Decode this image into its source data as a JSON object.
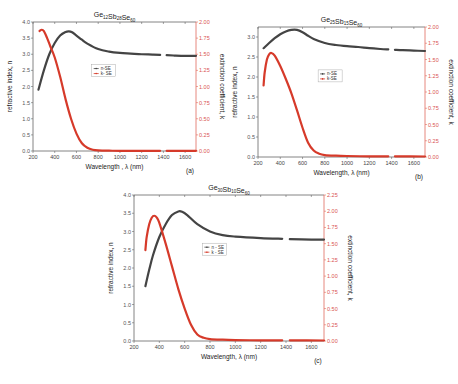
{
  "chart_data": [
    {
      "type": "line",
      "panel": "(a)",
      "title": "Ge12Sb28Se60",
      "title_parts": {
        "el1": "Ge",
        "n1": "12",
        "el2": "Sb",
        "n2": "28",
        "el3": "Se",
        "n3": "60"
      },
      "xlabel": "Wavelength , λ (nm)",
      "ylabel": "refractive index, n",
      "y2label": "extinction coefficient, k",
      "xlim": [
        200,
        1700
      ],
      "ylim": [
        0,
        4.0
      ],
      "y2lim": [
        0,
        2.0
      ],
      "xticks": [
        "200",
        "400",
        "600",
        "800",
        "1000",
        "1200",
        "1400",
        "1600"
      ],
      "yticks": [
        "0.0",
        "0.5",
        "1.0",
        "1.5",
        "2.0",
        "2.5",
        "3.0",
        "3.5",
        "4.0"
      ],
      "y2ticks": [
        "0.00",
        "0.25",
        "0.50",
        "0.75",
        "1.00",
        "1.25",
        "1.50",
        "1.75",
        "2.00"
      ],
      "legend": [
        "n-SE",
        "k- SE"
      ],
      "grid": false,
      "series": [
        {
          "name": "n-SE",
          "axis": "left",
          "color": "#444444",
          "x": [
            250,
            300,
            350,
            400,
            450,
            500,
            530,
            560,
            600,
            650,
            700,
            800,
            900,
            1000,
            1100,
            1200,
            1300,
            1370,
            1430,
            1500,
            1600,
            1700
          ],
          "y": [
            1.9,
            2.5,
            3.0,
            3.35,
            3.58,
            3.69,
            3.71,
            3.68,
            3.58,
            3.45,
            3.33,
            3.16,
            3.08,
            3.04,
            3.02,
            3.0,
            2.99,
            2.98,
            2.97,
            2.96,
            2.95,
            2.95
          ]
        },
        {
          "name": "k- SE",
          "axis": "right",
          "color": "#d63a2a",
          "x": [
            260,
            280,
            300,
            330,
            360,
            400,
            450,
            500,
            550,
            600,
            650,
            700,
            750,
            800,
            900,
            1000,
            1200,
            1370,
            1430,
            1700
          ],
          "y": [
            1.86,
            1.88,
            1.86,
            1.75,
            1.62,
            1.45,
            1.15,
            0.8,
            0.5,
            0.27,
            0.12,
            0.05,
            0.02,
            0.01,
            0.005,
            0.003,
            0.002,
            0.002,
            0.002,
            0.002
          ]
        }
      ]
    },
    {
      "type": "line",
      "panel": "(b)",
      "title": "Ge25Sb15Se60",
      "title_parts": {
        "el1": "Ge",
        "n1": "25",
        "el2": "Sb",
        "n2": "15",
        "el3": "Se",
        "n3": "60"
      },
      "xlabel": "Wavelength, λ (nm)",
      "ylabel": "refractive index, n",
      "y2label": "extinction coefficient, k",
      "xlim": [
        200,
        1700
      ],
      "ylim": [
        0,
        3.25
      ],
      "y2lim": [
        0,
        2.0
      ],
      "xticks": [
        "200",
        "400",
        "600",
        "800",
        "1000",
        "1200",
        "1400",
        "1600"
      ],
      "yticks": [
        "0.0",
        "0.5",
        "1.0",
        "1.5",
        "2.0",
        "2.5",
        "3.0"
      ],
      "y2ticks": [
        "0.00",
        "0.25",
        "0.50",
        "0.75",
        "1.00",
        "1.25",
        "1.50",
        "1.75",
        "2.00"
      ],
      "legend": [
        "n-SE",
        "k-SE"
      ],
      "grid": false,
      "series": [
        {
          "name": "n-SE",
          "axis": "left",
          "color": "#444444",
          "x": [
            250,
            300,
            350,
            400,
            450,
            500,
            550,
            600,
            650,
            700,
            800,
            900,
            1000,
            1100,
            1200,
            1300,
            1370,
            1430,
            1500,
            1600,
            1700
          ],
          "y": [
            2.72,
            2.85,
            2.97,
            3.07,
            3.14,
            3.18,
            3.18,
            3.12,
            3.03,
            2.95,
            2.85,
            2.8,
            2.77,
            2.75,
            2.72,
            2.7,
            2.69,
            2.68,
            2.67,
            2.66,
            2.65
          ]
        },
        {
          "name": "k-SE",
          "axis": "right",
          "color": "#d63a2a",
          "x": [
            250,
            260,
            280,
            300,
            320,
            350,
            400,
            450,
            500,
            550,
            600,
            650,
            700,
            750,
            800,
            900,
            1000,
            1200,
            1370,
            1430,
            1700
          ],
          "y": [
            1.1,
            1.3,
            1.5,
            1.58,
            1.6,
            1.56,
            1.4,
            1.2,
            0.98,
            0.72,
            0.45,
            0.22,
            0.1,
            0.05,
            0.03,
            0.02,
            0.015,
            0.01,
            0.01,
            0.01,
            0.008
          ]
        }
      ]
    },
    {
      "type": "line",
      "panel": "(c)",
      "title": "Ge30Sb10Se60",
      "title_parts": {
        "el1": "Ge",
        "n1": "30",
        "el2": "Sb",
        "n2": "10",
        "el3": "Se",
        "n3": "60"
      },
      "xlabel": "Wavelength, λ (nm)",
      "ylabel": "refractive index, n",
      "y2label": "extinction coefficient, k",
      "xlim": [
        200,
        1700
      ],
      "ylim": [
        0,
        4.0
      ],
      "y2lim": [
        0,
        2.25
      ],
      "xticks": [
        "200",
        "400",
        "600",
        "800",
        "1000",
        "1200",
        "1400",
        "1600"
      ],
      "yticks": [
        "0.0",
        "0.5",
        "1.0",
        "1.5",
        "2.0",
        "2.5",
        "3.0",
        "3.5",
        "4.0"
      ],
      "y2ticks": [
        "0.00",
        "0.25",
        "0.50",
        "0.75",
        "1.00",
        "1.25",
        "1.50",
        "1.75",
        "2.00",
        "2.25"
      ],
      "legend": [
        "n - SE",
        "k - SE"
      ],
      "grid": false,
      "series": [
        {
          "name": "n - SE",
          "axis": "left",
          "color": "#444444",
          "x": [
            290,
            320,
            350,
            400,
            450,
            500,
            550,
            580,
            620,
            700,
            800,
            900,
            1000,
            1200,
            1370,
            1430,
            1600,
            1700
          ],
          "y": [
            1.5,
            1.95,
            2.35,
            2.85,
            3.2,
            3.45,
            3.55,
            3.54,
            3.45,
            3.2,
            3.0,
            2.9,
            2.86,
            2.82,
            2.8,
            2.79,
            2.78,
            2.78
          ]
        },
        {
          "name": "k - SE",
          "axis": "right",
          "color": "#d63a2a",
          "x": [
            290,
            300,
            320,
            340,
            360,
            380,
            400,
            450,
            500,
            550,
            600,
            650,
            700,
            750,
            800,
            900,
            1000,
            1200,
            1370,
            1430,
            1700
          ],
          "y": [
            1.4,
            1.6,
            1.8,
            1.9,
            1.93,
            1.9,
            1.82,
            1.5,
            1.15,
            0.8,
            0.5,
            0.25,
            0.1,
            0.05,
            0.03,
            0.02,
            0.015,
            0.01,
            0.01,
            0.01,
            0.008
          ]
        }
      ]
    }
  ],
  "layout": {
    "panels": [
      {
        "x0": 33,
        "x1": 196,
        "y0": 22,
        "y1": 151
      },
      {
        "x0": 258,
        "x1": 425,
        "y0": 27,
        "y1": 157
      },
      {
        "x0": 134,
        "x1": 324,
        "y0": 195,
        "y1": 341
      }
    ],
    "colors": {
      "n": "#444444",
      "k": "#d63a2a",
      "right_axis": "#e0695e"
    }
  }
}
